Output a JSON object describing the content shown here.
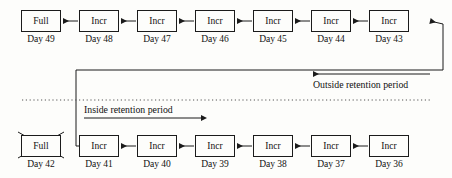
{
  "diagram": {
    "colors": {
      "background": "#fdfdfb",
      "stroke": "#1b1b1b",
      "text": "#111111"
    },
    "rows": [
      {
        "name": "upper-row",
        "nodes": [
          {
            "type": "Full",
            "label": "Full",
            "day": "Day 49",
            "crossed": false
          },
          {
            "type": "Incr",
            "label": "Incr",
            "day": "Day 48",
            "crossed": false
          },
          {
            "type": "Incr",
            "label": "Incr",
            "day": "Day 47",
            "crossed": false
          },
          {
            "type": "Incr",
            "label": "Incr",
            "day": "Day 46",
            "crossed": false
          },
          {
            "type": "Incr",
            "label": "Incr",
            "day": "Day 45",
            "crossed": false
          },
          {
            "type": "Incr",
            "label": "Incr",
            "day": "Day 44",
            "crossed": false
          },
          {
            "type": "Incr",
            "label": "Incr",
            "day": "Day 43",
            "crossed": false
          }
        ]
      },
      {
        "name": "lower-row",
        "nodes": [
          {
            "type": "Full",
            "label": "Full",
            "day": "Day 42",
            "crossed": true
          },
          {
            "type": "Incr",
            "label": "Incr",
            "day": "Day 41",
            "crossed": false
          },
          {
            "type": "Incr",
            "label": "Incr",
            "day": "Day 40",
            "crossed": false
          },
          {
            "type": "Incr",
            "label": "Incr",
            "day": "Day 39",
            "crossed": false
          },
          {
            "type": "Incr",
            "label": "Incr",
            "day": "Day 38",
            "crossed": false
          },
          {
            "type": "Incr",
            "label": "Incr",
            "day": "Day 37",
            "crossed": false
          },
          {
            "type": "Incr",
            "label": "Incr",
            "day": "Day 36",
            "crossed": false
          }
        ]
      }
    ],
    "annotations": {
      "outside_label": "Outside retention period",
      "inside_label": "Inside retention period"
    }
  }
}
